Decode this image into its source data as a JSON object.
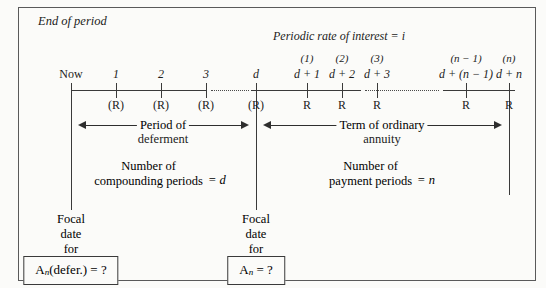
{
  "figure": {
    "end_of_period_label": "End of period",
    "interest_rate_label": "Periodic rate of interest  =  i"
  },
  "timeline": {
    "deferment_points": [
      {
        "period": "Now",
        "payment": "",
        "cashflow": ""
      },
      {
        "period": "1",
        "payment": "",
        "cashflow": "(R)"
      },
      {
        "period": "2",
        "payment": "",
        "cashflow": "(R)"
      },
      {
        "period": "3",
        "payment": "",
        "cashflow": "(R)"
      },
      {
        "period": "d",
        "payment": "",
        "cashflow": "(R)"
      }
    ],
    "annuity_points": [
      {
        "period": "d + 1",
        "payment": "(1)",
        "cashflow": "R"
      },
      {
        "period": "d + 2",
        "payment": "(2)",
        "cashflow": "R"
      },
      {
        "period": "d + 3",
        "payment": "(3)",
        "cashflow": "R"
      },
      {
        "period": "d + (n − 1)",
        "payment": "(n − 1)",
        "cashflow": "R"
      },
      {
        "period": "d + n",
        "payment": "(n)",
        "cashflow": "R"
      }
    ]
  },
  "brackets": {
    "deferment": {
      "title_line1": "Period of",
      "title_line2": "deferment",
      "count_line1": "Number of",
      "count_line2": "compounding periods",
      "count_equals": "= d"
    },
    "annuity": {
      "title_line1": "Term of ordinary",
      "title_line2": "annuity",
      "count_line1": "Number of",
      "count_line2": "payment periods",
      "count_equals": "= n"
    }
  },
  "focal_dates": {
    "left": {
      "line1": "Focal",
      "line2": "date",
      "line3": "for",
      "box_main": "A",
      "box_sub": "n",
      "box_rest": "(defer.)  =  ?"
    },
    "right": {
      "line1": "Focal",
      "line2": "date",
      "line3": "for",
      "box_main": "A",
      "box_sub": "n",
      "box_rest": "  =  ?"
    }
  }
}
